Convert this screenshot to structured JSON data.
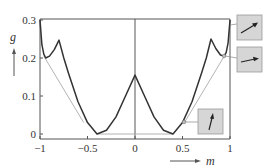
{
  "chart_data": {
    "type": "line",
    "title": "",
    "xlabel": "m",
    "ylabel": "g",
    "xlim": [
      -1,
      1
    ],
    "ylim": [
      0,
      0.3
    ],
    "xticks": [
      -1,
      -0.5,
      0,
      0.5,
      1
    ],
    "xtick_labels": [
      "−1",
      "−0.5",
      "0",
      "0.5",
      "1"
    ],
    "yticks": [
      0,
      0.1,
      0.2,
      0.3
    ],
    "ytick_labels": [
      "0",
      "0.1",
      "0.2",
      "0.3"
    ],
    "grid": false,
    "legend": null,
    "series": [
      {
        "name": "g(m) free energy curve",
        "color": "#333333",
        "x": [
          -1.0,
          -0.98,
          -0.96,
          -0.94,
          -0.9,
          -0.85,
          -0.8,
          -0.75,
          -0.7,
          -0.6,
          -0.5,
          -0.4,
          -0.3,
          -0.2,
          -0.1,
          0.0,
          0.1,
          0.2,
          0.3,
          0.4,
          0.5,
          0.6,
          0.7,
          0.75,
          0.8,
          0.85,
          0.9,
          0.94,
          0.96,
          0.98,
          1.0
        ],
        "y": [
          0.3,
          0.235,
          0.21,
          0.2,
          0.205,
          0.222,
          0.247,
          0.2,
          0.16,
          0.085,
          0.03,
          0.0,
          0.01,
          0.045,
          0.1,
          0.155,
          0.1,
          0.045,
          0.01,
          0.0,
          0.03,
          0.085,
          0.16,
          0.2,
          0.25,
          0.225,
          0.208,
          0.205,
          0.215,
          0.24,
          0.3
        ]
      },
      {
        "name": "common tangent lines",
        "color": "#aaaaaa",
        "segments": [
          {
            "x": [
              -0.96,
              -0.54
            ],
            "y": [
              0.205,
              0.03
            ]
          },
          {
            "x": [
              -0.4,
              0.4
            ],
            "y": [
              0.0,
              0.0
            ]
          },
          {
            "x": [
              0.52,
              0.94
            ],
            "y": [
              0.03,
              0.205
            ]
          }
        ]
      }
    ],
    "annotations": [
      {
        "type": "inset",
        "label": "spin arrow pointing right-up",
        "anchor": {
          "m": 1.0,
          "g": 0.29
        }
      },
      {
        "type": "inset",
        "label": "spin arrow pointing right",
        "anchor": {
          "m": 0.94,
          "g": 0.205
        }
      },
      {
        "type": "inset",
        "label": "spin arrow pointing up",
        "anchor": {
          "m": 0.52,
          "g": 0.03
        }
      }
    ]
  }
}
